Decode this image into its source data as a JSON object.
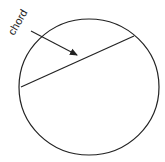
{
  "diagram": {
    "type": "circle-chord",
    "label": "chord",
    "colors": {
      "stroke": "#222222",
      "background": "#ffffff"
    },
    "circle": {
      "cx": 89,
      "cy": 87,
      "rx": 70,
      "ry": 68
    },
    "chord": {
      "x1": 21,
      "y1": 87,
      "x2": 134,
      "y2": 36
    },
    "arrow": {
      "x1": 31,
      "y1": 31,
      "x2": 77,
      "y2": 55
    }
  }
}
